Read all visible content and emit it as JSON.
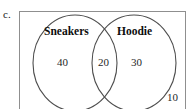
{
  "page": {
    "item_label": "c.",
    "clipped_top_text": "",
    "background_color": "#ffffff",
    "ink_color": "#1a1a1a",
    "circle_stroke_color": "#4d4d4d",
    "rect_stroke_color": "#8f8f8f"
  },
  "diagram": {
    "type": "venn-2-set",
    "universal_set": {
      "outside_count": "10"
    },
    "sets": [
      {
        "name": "Sneakers",
        "label": "Sneakers",
        "position": "left",
        "only_count": "40"
      },
      {
        "name": "Hoodie",
        "label": "Hoodie",
        "position": "right",
        "only_count": "30"
      }
    ],
    "intersection": {
      "label": "Sneakers and Hoodie",
      "count": "20"
    },
    "region_values": {
      "left_only": "40",
      "both": "20",
      "right_only": "30",
      "outside": "10"
    }
  }
}
